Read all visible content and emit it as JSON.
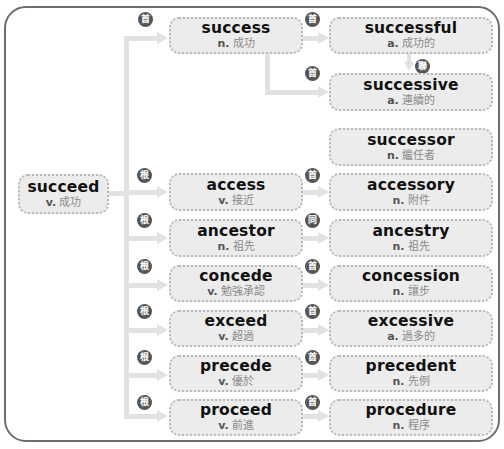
{
  "colors": {
    "frame_border": "#6e6e6e",
    "box_fill": "#ececec",
    "box_border": "#b8b8b8",
    "connector": "#e2e2e2",
    "badge_fill": "#555555",
    "word_text": "#111111",
    "definition_text": "#8a8a8a"
  },
  "badges": {
    "root": "根",
    "head": "首",
    "same": "同",
    "link": "聯"
  },
  "root_word": {
    "word": "succeed",
    "pos": "v.",
    "meaning": "成功"
  },
  "branches": [
    {
      "badge": "首",
      "word": {
        "word": "success",
        "pos": "n.",
        "meaning": "成功"
      },
      "children": [
        {
          "badge": "首",
          "word": "successful",
          "pos": "a.",
          "meaning": "成功的"
        },
        {
          "badge": "首",
          "word": "successive",
          "pos": "a.",
          "meaning": "連續的"
        }
      ],
      "relation_between_children": "聯"
    },
    {
      "badge": null,
      "word": null,
      "children": [
        {
          "badge": null,
          "word": "successor",
          "pos": "n.",
          "meaning": "繼任者"
        }
      ]
    },
    {
      "badge": "根",
      "word": {
        "word": "access",
        "pos": "v.",
        "meaning": "接近"
      },
      "children": [
        {
          "badge": "首",
          "word": "accessory",
          "pos": "n.",
          "meaning": "附件"
        }
      ]
    },
    {
      "badge": "根",
      "word": {
        "word": "ancestor",
        "pos": "n.",
        "meaning": "祖先"
      },
      "children": [
        {
          "badge": "同",
          "word": "ancestry",
          "pos": "n.",
          "meaning": "祖先"
        }
      ]
    },
    {
      "badge": "根",
      "word": {
        "word": "concede",
        "pos": "v.",
        "meaning": "勉強承認"
      },
      "children": [
        {
          "badge": "首",
          "word": "concession",
          "pos": "n.",
          "meaning": "讓步"
        }
      ]
    },
    {
      "badge": "根",
      "word": {
        "word": "exceed",
        "pos": "v.",
        "meaning": "超過"
      },
      "children": [
        {
          "badge": "首",
          "word": "excessive",
          "pos": "a.",
          "meaning": "過多的"
        }
      ]
    },
    {
      "badge": "根",
      "word": {
        "word": "precede",
        "pos": "v.",
        "meaning": "優於"
      },
      "children": [
        {
          "badge": "首",
          "word": "precedent",
          "pos": "n.",
          "meaning": "先例"
        }
      ]
    },
    {
      "badge": "根",
      "word": {
        "word": "proceed",
        "pos": "v.",
        "meaning": "前進"
      },
      "children": [
        {
          "badge": "首",
          "word": "procedure",
          "pos": "n.",
          "meaning": "程序"
        }
      ]
    }
  ]
}
